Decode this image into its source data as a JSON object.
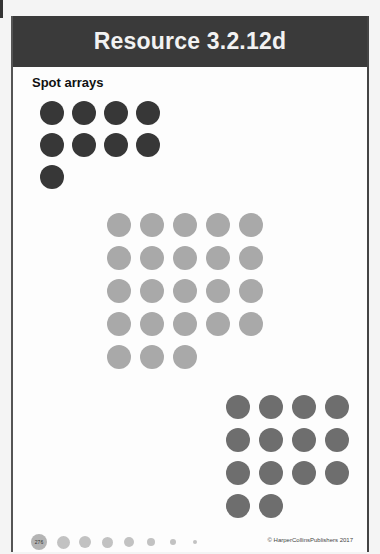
{
  "header": {
    "title": "Resource 3.2.12d"
  },
  "section": {
    "subtitle": "Spot arrays"
  },
  "arrays": [
    {
      "name": "dark-array",
      "count": 9,
      "columns": 4,
      "color": "#373737"
    },
    {
      "name": "light-array",
      "count": 23,
      "columns": 5,
      "color": "#a9a9a9"
    },
    {
      "name": "mid-array",
      "count": 14,
      "columns": 4,
      "color": "#6e6e6e"
    }
  ],
  "footer": {
    "page_number": "276",
    "copyright": "© HarperCollinsPublishers 2017"
  }
}
